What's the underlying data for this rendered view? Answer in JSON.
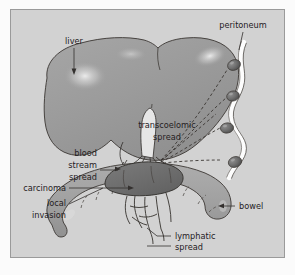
{
  "figure": {
    "background_color": "#d2d2d2",
    "border_color": "#9a9a9a",
    "page_background": "#fbfbfb"
  },
  "colors": {
    "liver_fill": "#9d9d9d",
    "liver_highlight": "#e7e7e7",
    "bowel_fill": "#a3a3a3",
    "tumour_fill": "#6d6d6d",
    "peritoneum_band": "#fdfdfd",
    "deposit_fill": "#6a6a6a",
    "ink": "#25211f",
    "vessel_stroke": "#2e2b28"
  },
  "labels": {
    "liver": "liver",
    "peritoneum": "peritoneum",
    "transcoelomic_line1": "transcoelomic",
    "transcoelomic_line2": "spread",
    "blood_line1": "blood",
    "blood_line2": "stream",
    "blood_line3": "spread",
    "carcinoma": "carcinoma",
    "local_line1": "local",
    "local_line2": "invasion",
    "bowel": "bowel",
    "lymphatic_line1": "lymphatic",
    "lymphatic_line2": "spread"
  },
  "structures": {
    "liver": {
      "name": "liver",
      "description": "large shaded organ upper left with two lobes and specular highlights"
    },
    "peritoneum": {
      "name": "peritoneum",
      "description": "wavy white membrane band along right side",
      "deposit_count": 4
    },
    "bowel": {
      "name": "bowel",
      "description": "curved tubular loop across lower half with haustral markings"
    },
    "carcinoma": {
      "name": "carcinoma",
      "description": "dark ovoid tumour mass on upper-left aspect of bowel"
    },
    "blood_vessels": {
      "name": "blood-stream-spread",
      "description": "branching pale vessels linking bowel tumour to liver"
    },
    "lymphatics": {
      "name": "lymphatic-spread",
      "description": "fine branching channels descending from the tumour"
    },
    "transcoelomic": {
      "name": "transcoelomic-spread",
      "description": "dashed trajectories from tumour to peritoneal deposits",
      "ray_count": 5
    }
  }
}
